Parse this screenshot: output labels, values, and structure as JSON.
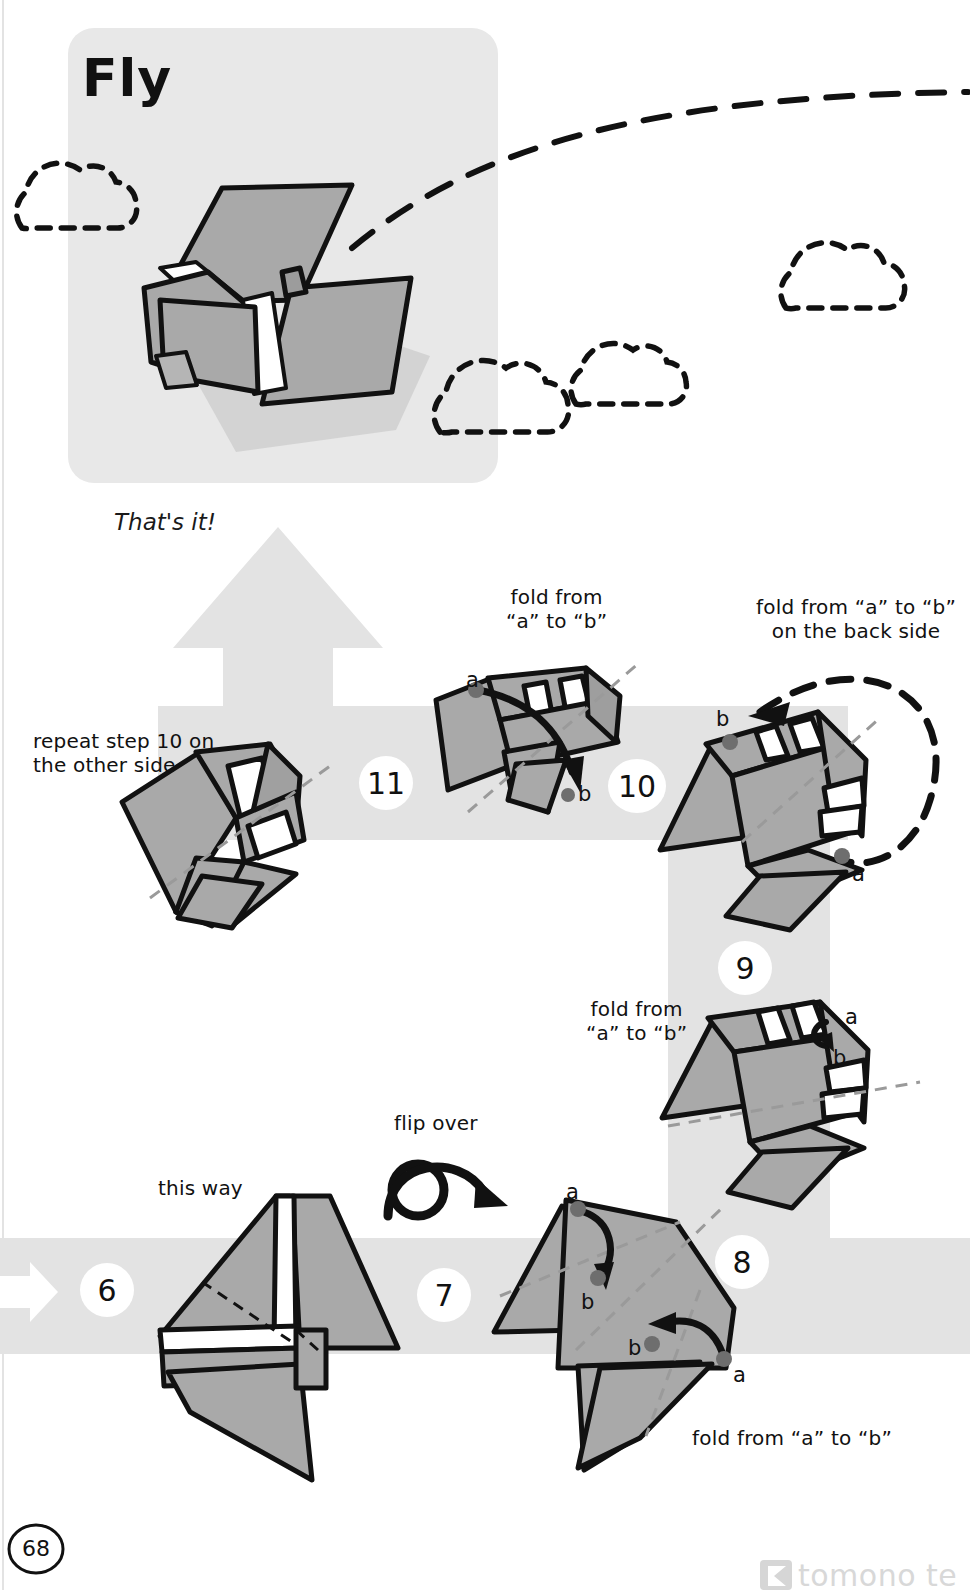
{
  "page": {
    "number": "68",
    "watermark": "tomono te",
    "width": 970,
    "height": 1590,
    "background": "#ffffff",
    "paper_fill": "#a9a9a9",
    "paper_fill_dark": "#9a9a9a",
    "paper_white": "#ffffff",
    "ink": "#111111",
    "band_grey": "#e0e0e0",
    "panel_grey": "#e6e6e6",
    "dot_grey": "#6e6e6e"
  },
  "hero": {
    "title": "Fly",
    "panel": {
      "x": 68,
      "y": 28,
      "w": 430,
      "h": 455,
      "radius": 26
    },
    "clouds": [
      {
        "name": "cloud-left",
        "x": 14,
        "y": 160,
        "scale": 1.0
      },
      {
        "name": "cloud-mid",
        "x": 432,
        "y": 322,
        "scale": 1.2
      },
      {
        "name": "cloud-mid-2",
        "x": 572,
        "y": 318,
        "scale": 0.95
      },
      {
        "name": "cloud-right",
        "x": 778,
        "y": 218,
        "scale": 1.05
      }
    ],
    "flight_path_label": "dashed-flight-path"
  },
  "captions": {
    "thats_it": "That's it!",
    "repeat_step_10": "repeat step 10 on\nthe other side",
    "fold_a_to_b_10": "fold from\n“a” to “b”",
    "fold_a_to_b_back": "fold from “a” to “b”\non the back side",
    "fold_a_to_b_9": "fold from\n“a” to “b”",
    "flip_over": "flip over",
    "this_way": "this way",
    "fold_a_to_b_7": "fold from “a” to “b”"
  },
  "steps": [
    {
      "id": "step-6",
      "number": "6",
      "cx": 107,
      "cy": 1290,
      "r": 27
    },
    {
      "id": "step-7",
      "number": "7",
      "cx": 444,
      "cy": 1295,
      "r": 27
    },
    {
      "id": "step-8",
      "number": "8",
      "cx": 742,
      "cy": 1262,
      "r": 27
    },
    {
      "id": "step-9",
      "number": "9",
      "cx": 745,
      "cy": 968,
      "r": 27
    },
    {
      "id": "step-10",
      "number": "10",
      "cx": 637,
      "cy": 786,
      "r": 27
    },
    {
      "id": "step-11",
      "number": "11",
      "cx": 386,
      "cy": 783,
      "r": 27
    }
  ],
  "point_labels": [
    {
      "name": "label-a-step-11",
      "text": "a",
      "x": 466,
      "y": 668
    },
    {
      "name": "label-b-step-11",
      "text": "b",
      "x": 578,
      "y": 782
    },
    {
      "name": "label-b-step-10",
      "text": "b",
      "x": 716,
      "y": 707
    },
    {
      "name": "label-a-step-10",
      "text": "a",
      "x": 852,
      "y": 862
    },
    {
      "name": "label-a-step-9",
      "text": "a",
      "x": 845,
      "y": 1005
    },
    {
      "name": "label-b-step-9",
      "text": "b",
      "x": 833,
      "y": 1046
    },
    {
      "name": "label-a-step-7-top",
      "text": "a",
      "x": 566,
      "y": 1180
    },
    {
      "name": "label-b-step-7-top",
      "text": "b",
      "x": 581,
      "y": 1290
    },
    {
      "name": "label-b-step-7-bottom",
      "text": "b",
      "x": 628,
      "y": 1336
    },
    {
      "name": "label-a-step-7-bottom",
      "text": "a",
      "x": 733,
      "y": 1363
    }
  ]
}
